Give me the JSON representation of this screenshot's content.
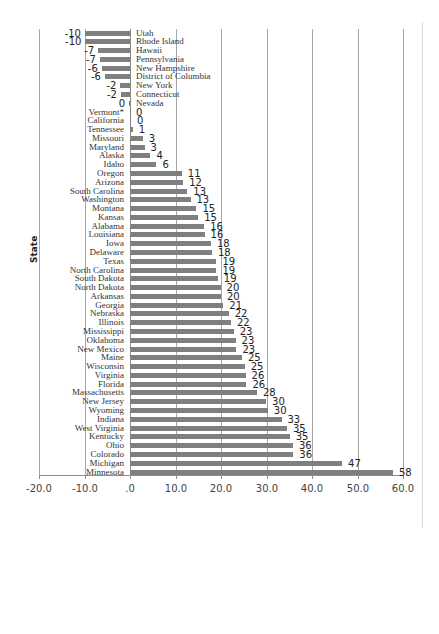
{
  "chart_data": {
    "type": "bar",
    "orientation": "horizontal",
    "title": "",
    "xlabel": "",
    "ylabel": "State",
    "xlim": [
      -20,
      60
    ],
    "x_ticks": [
      -20,
      -10,
      0,
      10,
      20,
      30,
      40,
      50,
      60
    ],
    "x_tick_labels": [
      "-20.0",
      "-10.0",
      ".0",
      "10.0",
      "20.0",
      "30.0",
      "40.0",
      "50.0",
      "60.0"
    ],
    "grid": "vertical",
    "legend": "none",
    "bar_color": "#7f7f7f",
    "categories": [
      "Utah",
      "Rhode Island",
      "Hawaii",
      "Pennsylvania",
      "New Hampshire",
      "District of Columbia",
      "New York",
      "Connecticut",
      "Nevada",
      "Vermont*",
      "California",
      "Tennessee",
      "Missouri",
      "Maryland",
      "Alaska",
      "Idaho",
      "Oregon",
      "Arizona",
      "South Carolina",
      "Washington",
      "Montana",
      "Kansas",
      "Alabama",
      "Louisiana",
      "Iowa",
      "Delaware",
      "Texas",
      "North Carolina",
      "South Dakota",
      "North Dakota",
      "Arkansas",
      "Georgia",
      "Nebraska",
      "Illinois",
      "Mississippi",
      "Oklahoma",
      "New Mexico",
      "Maine",
      "Wisconsin",
      "Virginia",
      "Florida",
      "Massachusetts",
      "New Jersey",
      "Wyoming",
      "Indiana",
      "West Virginia",
      "Kentucky",
      "Ohio",
      "Colorado",
      "Michigan",
      "Minnesota"
    ],
    "values": [
      -10,
      -10,
      -7,
      -7,
      -6,
      -6,
      -2,
      -2,
      0,
      0,
      0,
      1,
      3,
      3,
      4,
      6,
      11,
      12,
      13,
      13,
      15,
      15,
      16,
      16,
      18,
      18,
      19,
      19,
      19,
      20,
      20,
      21,
      22,
      22,
      23,
      23,
      23,
      25,
      25,
      26,
      26,
      28,
      30,
      30,
      33,
      35,
      35,
      36,
      36,
      47,
      58
    ],
    "bar_extents": [
      -9.9,
      -9.8,
      -7.0,
      -6.6,
      -6.2,
      -5.5,
      -2.1,
      -2.0,
      -0.2,
      0,
      0.2,
      0.6,
      2.8,
      3.2,
      4.5,
      5.8,
      11.4,
      11.7,
      12.6,
      13.3,
      14.6,
      15.0,
      16.3,
      16.4,
      17.8,
      18.0,
      19.0,
      19.0,
      19.3,
      19.9,
      20.0,
      20.5,
      21.7,
      22.2,
      22.8,
      23.2,
      23.4,
      24.6,
      25.2,
      25.4,
      25.6,
      27.9,
      29.9,
      30.3,
      33.3,
      34.5,
      35.1,
      35.8,
      35.9,
      46.6,
      57.8
    ]
  }
}
